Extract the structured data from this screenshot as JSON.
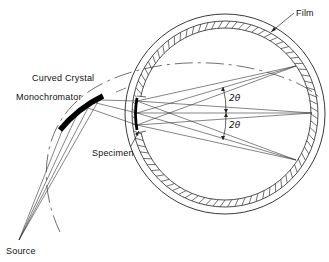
{
  "diagram": {
    "type": "x-ray diffraction camera schematic (Guinier / Seemann-Bohlin geometry)",
    "labels": {
      "film": "Film",
      "crystal_line1": "Curved Crystal",
      "crystal_line2": "Monochromator",
      "specimen": "Specimen",
      "source": "Source",
      "angle_upper": "2θ",
      "angle_lower": "2θ"
    },
    "components": [
      {
        "id": "source",
        "label": "Source"
      },
      {
        "id": "monochromator",
        "label": "Curved Crystal Monochromator"
      },
      {
        "id": "specimen",
        "label": "Specimen"
      },
      {
        "id": "film",
        "label": "Film"
      },
      {
        "id": "camera-circle",
        "label": ""
      }
    ],
    "colors": {
      "ink": "#111111",
      "background": "#ffffff"
    }
  }
}
